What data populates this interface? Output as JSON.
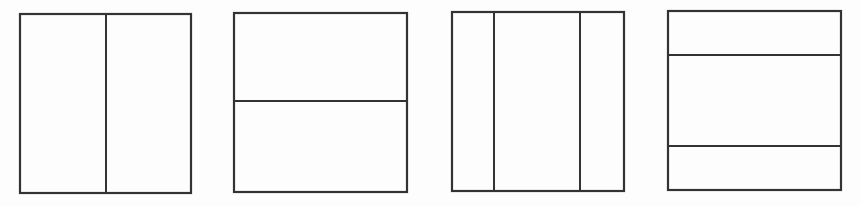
{
  "diagram": {
    "stroke_color": "#333333",
    "background_color": "#fdfdfd",
    "panels": [
      {
        "id": "panel-1",
        "division": "vertical",
        "sections": 2,
        "rect": {
          "x": 20,
          "y": 14,
          "w": 171,
          "h": 179
        },
        "vertical_lines": [
          106
        ],
        "horizontal_lines": []
      },
      {
        "id": "panel-2",
        "division": "horizontal",
        "sections": 2,
        "rect": {
          "x": 234,
          "y": 13,
          "w": 173,
          "h": 179
        },
        "vertical_lines": [],
        "horizontal_lines": [
          101
        ]
      },
      {
        "id": "panel-3",
        "division": "vertical",
        "sections": 3,
        "rect": {
          "x": 452,
          "y": 12,
          "w": 172,
          "h": 179
        },
        "vertical_lines": [
          494,
          580
        ],
        "horizontal_lines": []
      },
      {
        "id": "panel-4",
        "division": "horizontal",
        "sections": 3,
        "rect": {
          "x": 668,
          "y": 11,
          "w": 173,
          "h": 179
        },
        "vertical_lines": [],
        "horizontal_lines": [
          55,
          146
        ]
      }
    ]
  }
}
